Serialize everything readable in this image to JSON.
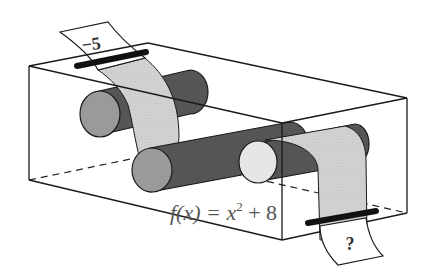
{
  "diagram": {
    "input_label": "−5",
    "output_label": "?",
    "function_label": {
      "prefix": "f(x) = x",
      "exponent": "2",
      "suffix": " + 8"
    }
  },
  "colors": {
    "outline": "#1a1a1a",
    "roller_dark": "#555555",
    "roller_end_mid": "#9a9a9a",
    "roller_end_light": "#e6e6e6",
    "tape": "#cfcfcf",
    "paper": "#ffffff",
    "slot": "#111111"
  }
}
